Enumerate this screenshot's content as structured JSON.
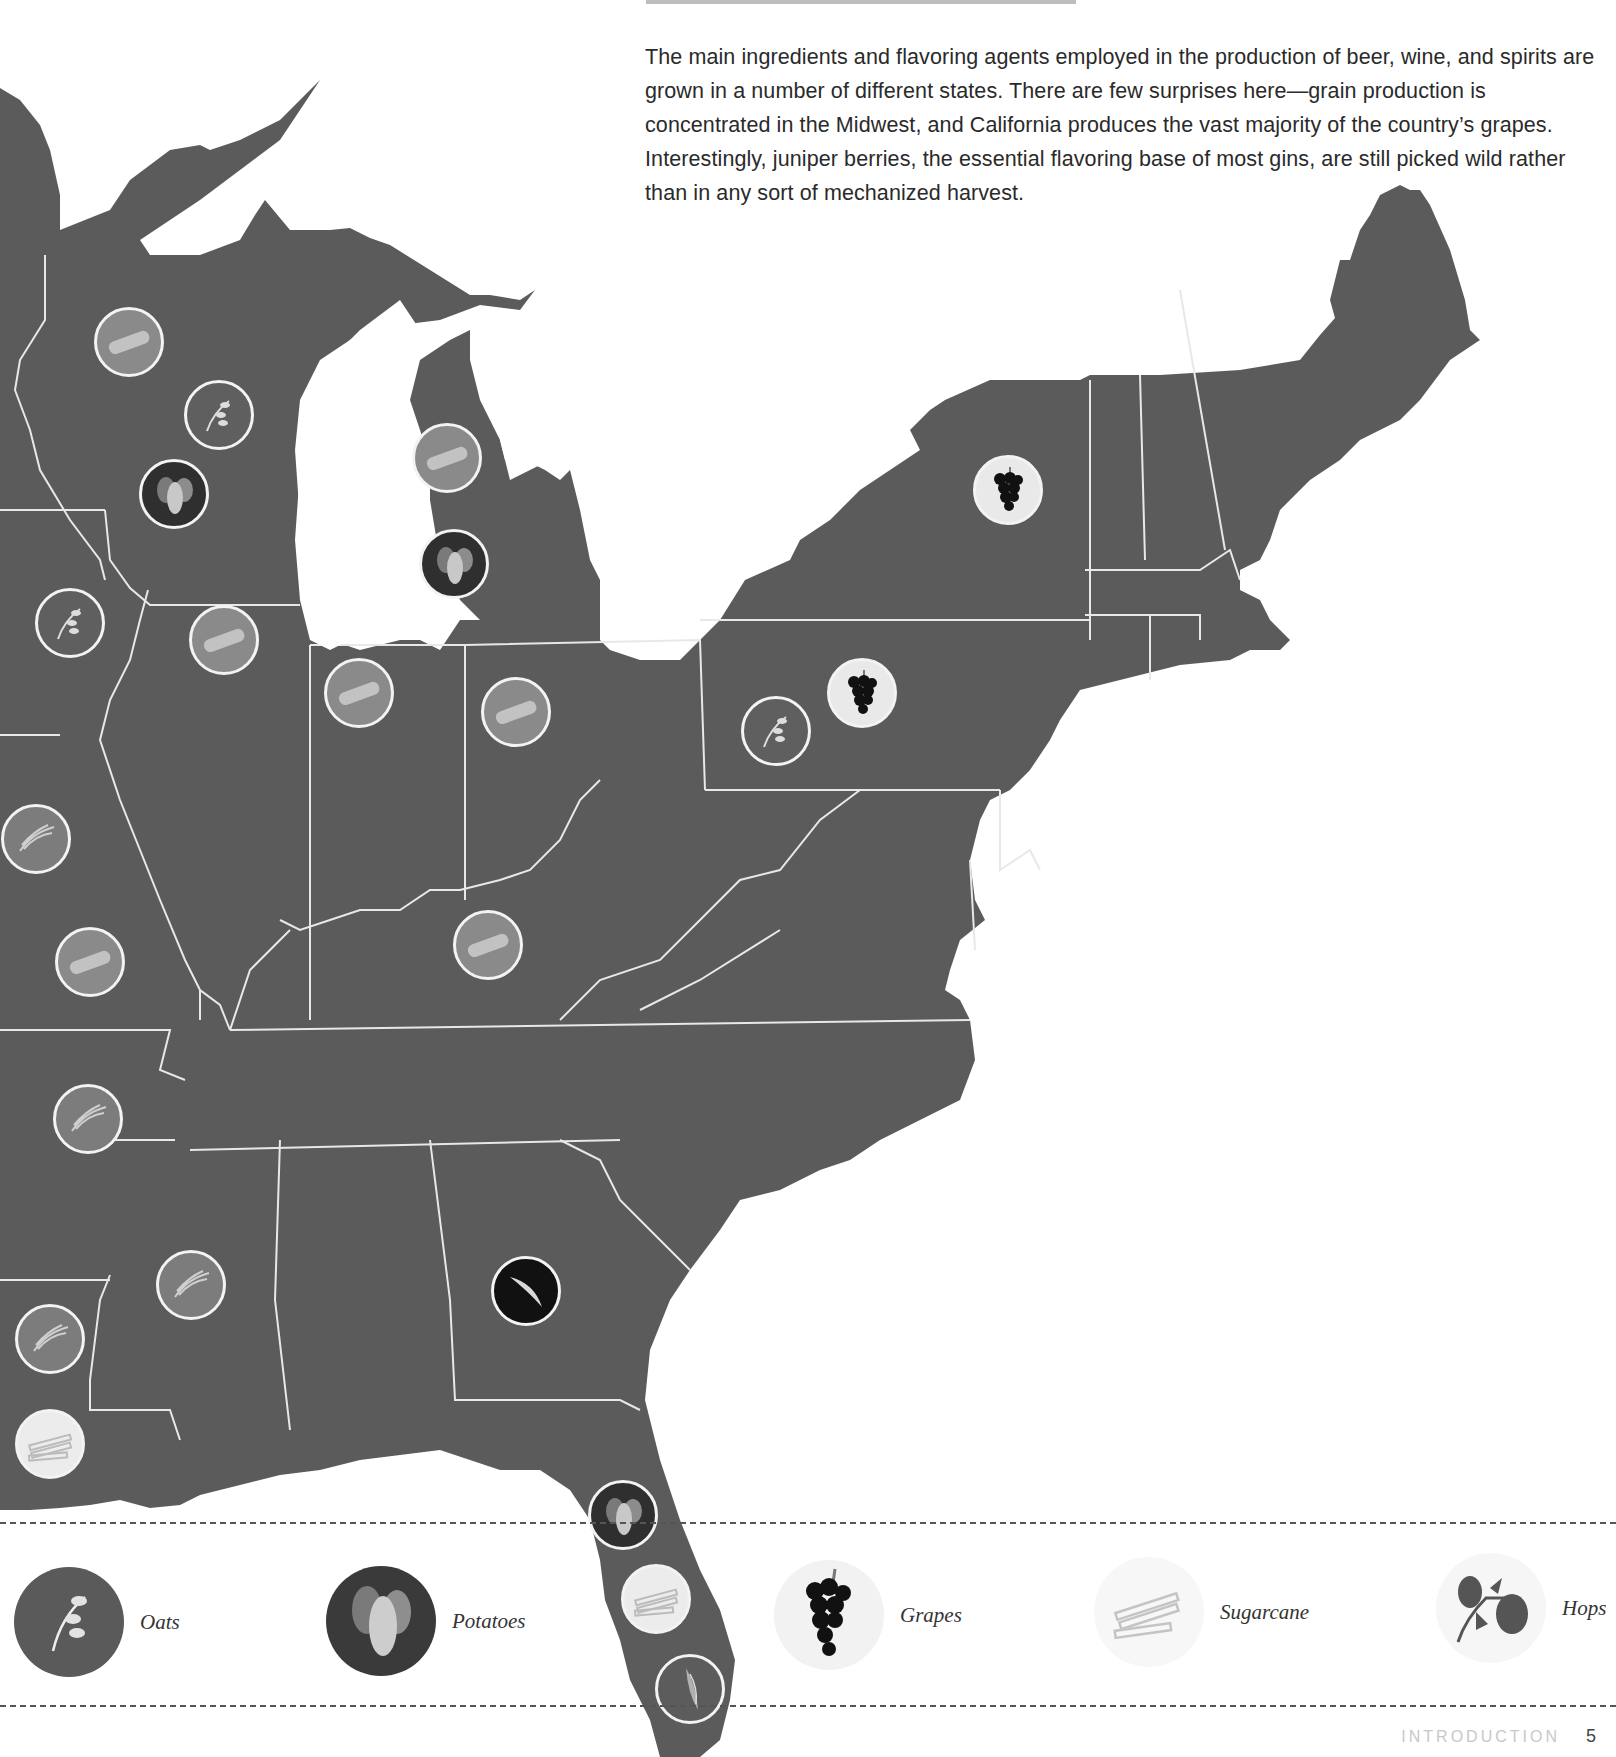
{
  "intro": {
    "text": "The main ingredients and flavoring agents employed in the production of beer, wine, and spirits are grown in a number of different states. There are few surprises here—grain production is concentrated in the Midwest, and California produces the vast majority of the country’s grapes. Interestingly, juniper berries, the essential flavoring base of most gins, are still picked wild rather than in any sort of mechanized harvest."
  },
  "colors": {
    "land": "#5b5b5b",
    "border": "#e8e8e8",
    "water": "#ffffff",
    "text": "#2a2a2a"
  },
  "map": {
    "region": "Eastern United States",
    "markers": [
      {
        "state": "Wisconsin",
        "crop": "corn",
        "icon": "corn-icon",
        "x": 129,
        "y": 342
      },
      {
        "state": "Wisconsin",
        "crop": "oats",
        "icon": "oats-icon",
        "x": 219,
        "y": 415
      },
      {
        "state": "Wisconsin",
        "crop": "potatoes",
        "icon": "potatoes-icon",
        "x": 174,
        "y": 494
      },
      {
        "state": "Michigan",
        "crop": "corn",
        "icon": "corn-icon",
        "x": 447,
        "y": 458
      },
      {
        "state": "Michigan",
        "crop": "potatoes",
        "icon": "potatoes-icon",
        "x": 454,
        "y": 564
      },
      {
        "state": "Iowa",
        "crop": "oats",
        "icon": "oats-icon",
        "x": 70,
        "y": 623
      },
      {
        "state": "Illinois",
        "crop": "corn",
        "icon": "corn-icon",
        "x": 224,
        "y": 640
      },
      {
        "state": "Indiana",
        "crop": "corn",
        "icon": "corn-icon",
        "x": 359,
        "y": 693
      },
      {
        "state": "Ohio",
        "crop": "corn",
        "icon": "corn-icon",
        "x": 516,
        "y": 712
      },
      {
        "state": "Pennsylvania",
        "crop": "oats",
        "icon": "oats-icon",
        "x": 776,
        "y": 731
      },
      {
        "state": "Pennsylvania",
        "crop": "grapes",
        "icon": "grapes-icon",
        "x": 862,
        "y": 693
      },
      {
        "state": "New York",
        "crop": "grapes",
        "icon": "grapes-icon",
        "x": 1008,
        "y": 490
      },
      {
        "state": "Missouri",
        "crop": "rice",
        "icon": "rice-icon",
        "x": 36,
        "y": 839
      },
      {
        "state": "Missouri",
        "crop": "corn",
        "icon": "corn-icon",
        "x": 90,
        "y": 962
      },
      {
        "state": "Kentucky",
        "crop": "corn",
        "icon": "corn-icon",
        "x": 488,
        "y": 945
      },
      {
        "state": "Arkansas",
        "crop": "rice",
        "icon": "rice-icon",
        "x": 88,
        "y": 1119
      },
      {
        "state": "Mississippi",
        "crop": "rice",
        "icon": "rice-icon",
        "x": 191,
        "y": 1285
      },
      {
        "state": "Louisiana",
        "crop": "rice",
        "icon": "rice-icon",
        "x": 50,
        "y": 1339
      },
      {
        "state": "Louisiana",
        "crop": "sugarcane",
        "icon": "sugarcane-icon",
        "x": 50,
        "y": 1444
      },
      {
        "state": "Georgia",
        "crop": "juniper",
        "icon": "juniper-icon",
        "x": 526,
        "y": 1291
      },
      {
        "state": "Florida",
        "crop": "potatoes",
        "icon": "potatoes-icon",
        "x": 623,
        "y": 1515
      },
      {
        "state": "Florida",
        "crop": "sugarcane",
        "icon": "sugarcane-icon",
        "x": 656,
        "y": 1599
      },
      {
        "state": "Florida",
        "crop": "wheat",
        "icon": "wheat-icon",
        "x": 690,
        "y": 1689
      }
    ]
  },
  "legend": {
    "items": [
      {
        "label": "Oats",
        "icon": "oats-icon",
        "x": 14,
        "y": 1567
      },
      {
        "label": "Potatoes",
        "icon": "potatoes-icon",
        "x": 326,
        "y": 1566
      },
      {
        "label": "Grapes",
        "icon": "grapes-icon",
        "x": 774,
        "y": 1560
      },
      {
        "label": "Sugarcane",
        "icon": "sugarcane-icon",
        "x": 1094,
        "y": 1557
      },
      {
        "label": "Hops",
        "icon": "hops-icon",
        "x": 1436,
        "y": 1553
      }
    ]
  },
  "footer": {
    "section": "INTRODUCTION",
    "page": "5"
  }
}
